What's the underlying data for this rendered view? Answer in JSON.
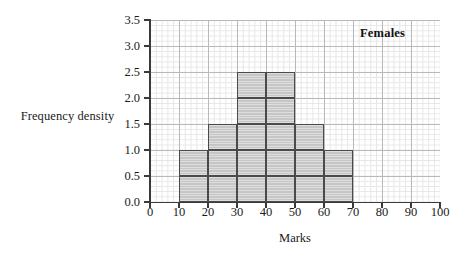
{
  "chart_data": {
    "type": "bar",
    "title": "",
    "subtitle": "",
    "xlabel": "Marks",
    "ylabel": "Frequency density",
    "series_label": "Females",
    "xlim": [
      0,
      100
    ],
    "ylim": [
      0.0,
      3.5
    ],
    "grid": true,
    "legend_position": "top-right-inside",
    "bin_edges": [
      10,
      20,
      30,
      40,
      50,
      60,
      70
    ],
    "categories": [
      "10-20",
      "20-30",
      "30-40",
      "40-50",
      "50-60",
      "60-70"
    ],
    "values": [
      1.0,
      1.5,
      2.5,
      2.5,
      1.5,
      1.0
    ],
    "bars": [
      {
        "label": "10-20",
        "start": 10,
        "end": 20,
        "value": 1.0
      },
      {
        "label": "20-30",
        "start": 20,
        "end": 30,
        "value": 1.5
      },
      {
        "label": "30-40",
        "start": 30,
        "end": 40,
        "value": 2.5
      },
      {
        "label": "40-50",
        "start": 40,
        "end": 50,
        "value": 2.5
      },
      {
        "label": "50-60",
        "start": 50,
        "end": 60,
        "value": 1.5
      },
      {
        "label": "60-70",
        "start": 60,
        "end": 70,
        "value": 1.0
      }
    ],
    "x_ticks": [
      "0",
      "10",
      "20",
      "30",
      "40",
      "50",
      "60",
      "70",
      "80",
      "90",
      "100"
    ],
    "y_ticks": [
      "0.0",
      "0.5",
      "1.0",
      "1.5",
      "2.0",
      "2.5",
      "3.0",
      "3.5"
    ],
    "colors": {
      "bar_fill": "#c6c6c6",
      "bar_border": "#4a4a4a",
      "axis": "#3a3a3a",
      "grid_major": "#b9b9b9",
      "grid_minor": "#e6e6e6",
      "text": "#1a1a1a",
      "background": "#ffffff"
    }
  }
}
